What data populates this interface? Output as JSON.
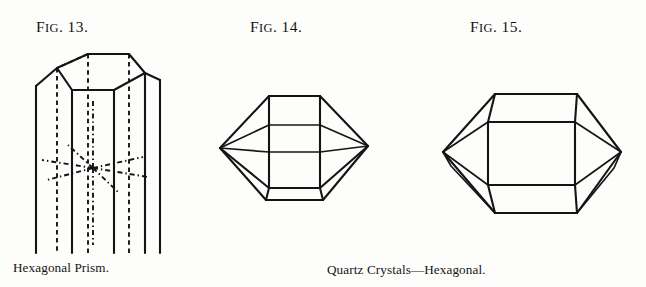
{
  "page": {
    "background_color": "#fdfdfb",
    "ink_color": "#141414",
    "width": 646,
    "height": 287
  },
  "figures": [
    {
      "id": "fig-13",
      "label_prefix": "F",
      "label_smallcaps": "IG",
      "label_number": ". 13.",
      "label_full": "Fig. 13.",
      "caption": "Hexagonal Prism.",
      "subject": "hexagonal-prism",
      "description": "Hexagonal prism drawn in perspective with dashed hidden edges and dash-dot crystallographic axes converging at the center"
    },
    {
      "id": "fig-14",
      "label_prefix": "F",
      "label_smallcaps": "IG",
      "label_number": ". 14.",
      "label_full": "Fig. 14.",
      "caption": "",
      "subject": "quartz-crystal-short",
      "description": "Short doubly-terminated hexagonal quartz crystal with rhombohedral terminations"
    },
    {
      "id": "fig-15",
      "label_prefix": "F",
      "label_smallcaps": "IG",
      "label_number": ". 15.",
      "label_full": "Fig. 15.",
      "caption": "",
      "subject": "quartz-crystal-long",
      "description": "Elongated doubly-terminated hexagonal quartz crystal with pointed terminations"
    }
  ],
  "captions": {
    "left": "Hexagonal Prism.",
    "center": "Quartz Crystals—Hexagonal."
  }
}
